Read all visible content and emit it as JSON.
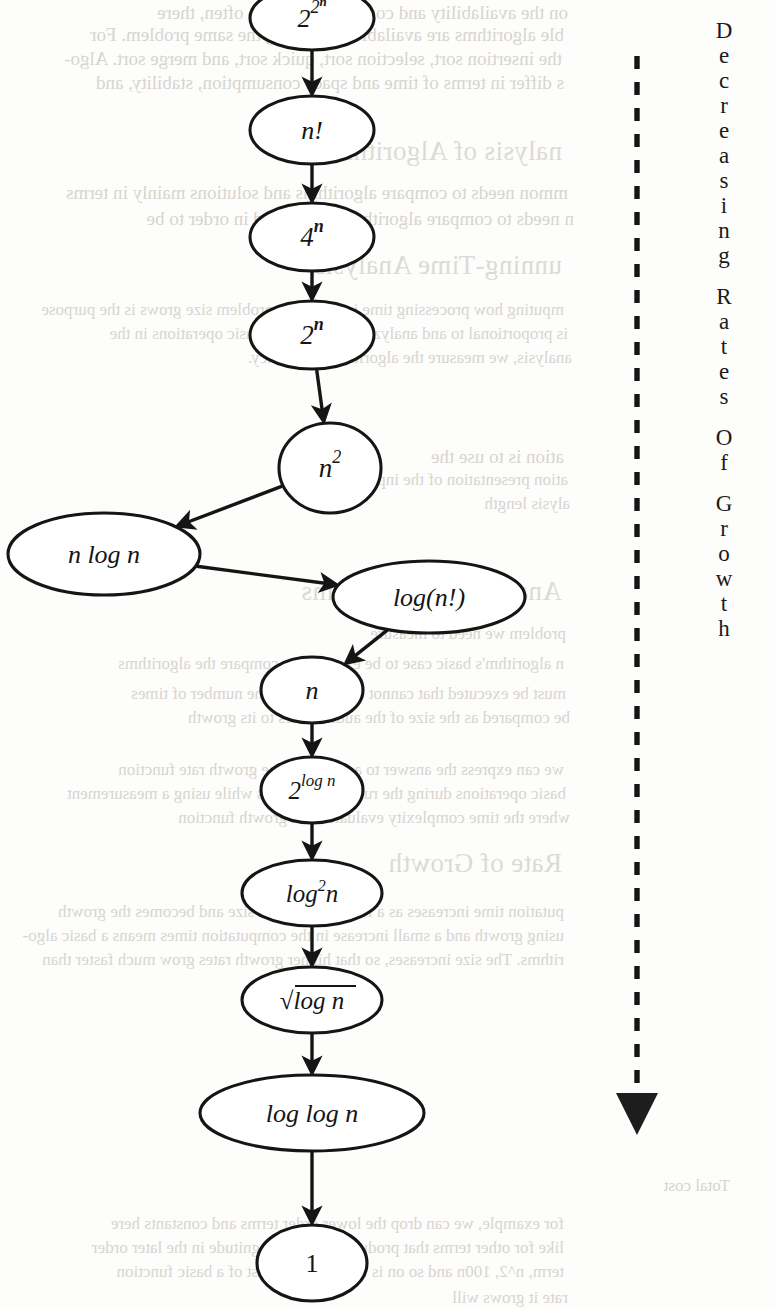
{
  "page": {
    "width": 776,
    "height": 1309,
    "background": "#fdfdfb",
    "ink": "#151515"
  },
  "axis_caption": {
    "name": "decreasing-rates-of-growth-axis",
    "words": [
      "Decreasing",
      "Rates",
      "Of",
      "Growth"
    ],
    "direction": "downward-arrow",
    "line_style": "dashed"
  },
  "chart_data": {
    "type": "diagram",
    "subtype": "growth-rate hierarchy flowchart",
    "node_shape": "ellipse",
    "edge_style": "solid-arrow",
    "axis_annotation": "Decreasing Rates Of Growth",
    "nodes": [
      {
        "id": "n0",
        "label": "2",
        "sup": "2ⁿ",
        "cx": 312,
        "cy": 18,
        "rx": 62,
        "ry": 32,
        "order": 1
      },
      {
        "id": "n1",
        "label": "n!",
        "sup": "",
        "cx": 312,
        "cy": 130,
        "rx": 62,
        "ry": 34,
        "order": 2
      },
      {
        "id": "n2",
        "label": "4",
        "sup": "n",
        "cx": 312,
        "cy": 237,
        "rx": 62,
        "ry": 34,
        "order": 3
      },
      {
        "id": "n3",
        "label": "2",
        "sup": "n",
        "cx": 312,
        "cy": 335,
        "rx": 62,
        "ry": 34,
        "order": 4
      },
      {
        "id": "n4",
        "label": "n",
        "sup": "2",
        "cx": 330,
        "cy": 468,
        "rx": 51,
        "ry": 45,
        "order": 5
      },
      {
        "id": "n5",
        "label": "n log n",
        "sup": "",
        "cx": 104,
        "cy": 554,
        "rx": 96,
        "ry": 41,
        "order": 6
      },
      {
        "id": "n6",
        "label": "log(n!)",
        "sup": "",
        "cx": 429,
        "cy": 597,
        "rx": 96,
        "ry": 36,
        "order": 7
      },
      {
        "id": "n7",
        "label": "n",
        "sup": "",
        "cx": 312,
        "cy": 690,
        "rx": 51,
        "ry": 33,
        "order": 8
      },
      {
        "id": "n8",
        "label": "2",
        "sup": "log n",
        "cx": 312,
        "cy": 790,
        "rx": 51,
        "ry": 33,
        "order": 9
      },
      {
        "id": "n9",
        "label": "log²n",
        "sup": "",
        "cx": 312,
        "cy": 893,
        "rx": 70,
        "ry": 33,
        "order": 10
      },
      {
        "id": "n10",
        "label": "√log n",
        "sup": "",
        "cx": 312,
        "cy": 1000,
        "rx": 70,
        "ry": 33,
        "order": 11
      },
      {
        "id": "n11",
        "label": "log log n",
        "sup": "",
        "cx": 312,
        "cy": 1113,
        "rx": 112,
        "ry": 38,
        "order": 12
      },
      {
        "id": "n12",
        "label": "1",
        "sup": "",
        "cx": 312,
        "cy": 1263,
        "rx": 55,
        "ry": 38,
        "order": 13
      }
    ],
    "edges": [
      {
        "from": "n0",
        "to": "n1"
      },
      {
        "from": "n1",
        "to": "n2"
      },
      {
        "from": "n2",
        "to": "n3"
      },
      {
        "from": "n3",
        "to": "n4"
      },
      {
        "from": "n4",
        "to": "n5"
      },
      {
        "from": "n5",
        "to": "n6"
      },
      {
        "from": "n6",
        "to": "n7"
      },
      {
        "from": "n7",
        "to": "n8"
      },
      {
        "from": "n8",
        "to": "n9"
      },
      {
        "from": "n9",
        "to": "n10"
      },
      {
        "from": "n10",
        "to": "n11"
      },
      {
        "from": "n11",
        "to": "n12"
      }
    ],
    "ordered_sequence": [
      "2^(2^n)",
      "n!",
      "4^n",
      "2^n",
      "n^2",
      "n log n",
      "log(n!)",
      "n",
      "2^(log n)",
      "log^2 n",
      "sqrt(log n)",
      "log log n",
      "1"
    ]
  },
  "ghost_text": {
    "note": "faint mirrored bleed-through from the reverse side of the scanned page",
    "lines": [
      {
        "text": "on the availability and convenience. More often, there",
        "x": 8,
        "y": 2,
        "cls": "b"
      },
      {
        "text": "ble algorithms are available for solving the same problem. For",
        "x": 4,
        "y": 24,
        "cls": "b"
      },
      {
        "text": "the insertion sort, selection sort, quick sort, and merge sort. Algo-",
        "x": 2,
        "y": 48,
        "cls": "b"
      },
      {
        "text": "s differ in terms of time and space consumption, stability, and",
        "x": 4,
        "y": 72,
        "cls": "b"
      },
      {
        "text": "nalysis of Algorithms",
        "x": 2,
        "y": 136,
        "cls": "h"
      },
      {
        "text": "mmon needs to compare algorithms and solutions mainly in terms",
        "x": 8,
        "y": 182,
        "cls": "b"
      },
      {
        "text": "n needs to compare algorithms, developed in order to be",
        "x": 14,
        "y": 208,
        "cls": "b"
      },
      {
        "text": "unning-Time Analysis",
        "x": 2,
        "y": 250,
        "cls": "h"
      },
      {
        "text": "mputing how processing time increases as problem size grows is the purpose",
        "x": 4,
        "y": 300,
        "cls": "sm"
      },
      {
        "text": "is proportional to and analyze the number of basic operations in the",
        "x": 8,
        "y": 324,
        "cls": "sm"
      },
      {
        "text": "analysis, we measure the algorithm's efficiency.",
        "x": 12,
        "y": 348,
        "cls": "sm"
      },
      {
        "text": "ation is to use the",
        "x": 4,
        "y": 446,
        "cls": "b"
      },
      {
        "text": "ation presentation of the input.",
        "x": 8,
        "y": 470,
        "cls": "sm"
      },
      {
        "text": "alysis length",
        "x": 10,
        "y": 494,
        "cls": "sm"
      },
      {
        "text": "Analysis of Algorithms",
        "x": 2,
        "y": 576,
        "cls": "h"
      },
      {
        "text": "problem we need to measure",
        "x": 6,
        "y": 624,
        "cls": "sm"
      },
      {
        "text": "n algorithm's basic case to be executed to compare the algorithms",
        "x": 4,
        "y": 654,
        "cls": "sm"
      },
      {
        "text": "must be executed that cannot be done since the number of times",
        "x": 6,
        "y": 684,
        "cls": "sm"
      },
      {
        "text": "be compared as the size of the audit relates to its growth",
        "x": 10,
        "y": 708,
        "cls": "sm"
      },
      {
        "text": "we can express the answer to a running-time growth rate function",
        "x": 4,
        "y": 760,
        "cls": "sm"
      },
      {
        "text": "basic operations during the running programs while using a measurement",
        "x": 6,
        "y": 784,
        "cls": "sm"
      },
      {
        "text": "where the time complexity evaluates to a growth function",
        "x": 10,
        "y": 808,
        "cls": "sm"
      },
      {
        "text": "Rate of Growth",
        "x": 2,
        "y": 848,
        "cls": "h"
      },
      {
        "text": "putation time increases as a function of input size and becomes the growth",
        "x": 4,
        "y": 902,
        "cls": "sm"
      },
      {
        "text": "using growth and a small increase in the computation times means a basic algo-",
        "x": 4,
        "y": 926,
        "cls": "sm"
      },
      {
        "text": "rithms. The size increases, so that higher growth rates grow much faster than",
        "x": 4,
        "y": 950,
        "cls": "sm"
      },
      {
        "text": "Total cost",
        "x": 170,
        "y": 1176,
        "cls": "sm"
      },
      {
        "text": "Total cost",
        "x": 320,
        "y": 1176,
        "cls": "sm"
      },
      {
        "text": "for example, we can drop the lower order terms and constants here",
        "x": 4,
        "y": 1214,
        "cls": "sm"
      },
      {
        "text": "like for other terms that produce the high magnitude in the later order",
        "x": 4,
        "y": 1238,
        "cls": "sm"
      },
      {
        "text": "term, n^2, 100n and so on is the dominant cost of a basic function",
        "x": 4,
        "y": 1262,
        "cls": "sm"
      },
      {
        "text": "rate it grows will",
        "x": 8,
        "y": 1288,
        "cls": "sm"
      }
    ]
  }
}
